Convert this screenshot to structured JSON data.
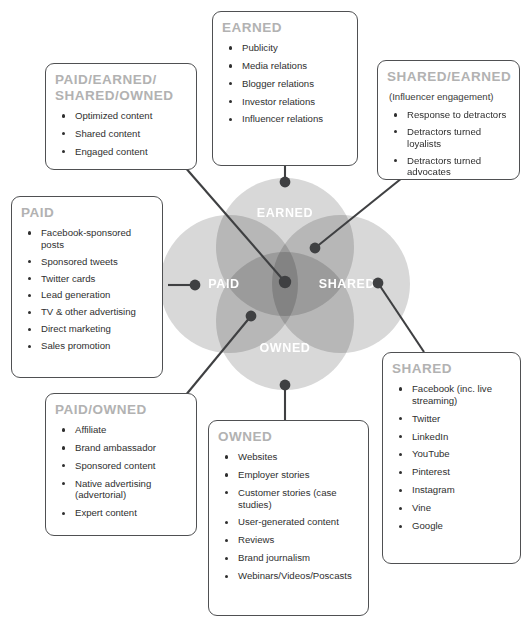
{
  "diagram": {
    "type": "venn-four-circle",
    "colors": {
      "circle_fill": "#c9c9c9",
      "circle_overlap": "#a8a8a8",
      "box_border": "#4f5052",
      "heading_text": "#b2b2b2",
      "body_text": "#2f2f2f",
      "venn_label_text": "#ffffff",
      "connector": "#3f4042",
      "background": "#ffffff"
    },
    "venn_labels": [
      {
        "name": "earned",
        "text": "EARNED"
      },
      {
        "name": "paid",
        "text": "PAID"
      },
      {
        "name": "shared",
        "text": "SHARED"
      },
      {
        "name": "owned",
        "text": "OWNED"
      }
    ]
  },
  "boxes": {
    "pes_owned": {
      "heading_line1": "PAID/EARNED/",
      "heading_line2": "SHARED/OWNED",
      "items": [
        "Optimized content",
        "Shared content",
        "Engaged content"
      ]
    },
    "earned": {
      "heading": "EARNED",
      "items": [
        "Publicity",
        "Media relations",
        "Blogger relations",
        "Investor relations",
        "Influencer relations"
      ]
    },
    "shared_earned": {
      "heading": "SHARED/EARNED",
      "subtitle": "(Influencer engagement)",
      "items": [
        "Response to detractors",
        "Detractors turned loyalists",
        "Detractors turned advocates"
      ]
    },
    "paid": {
      "heading": "PAID",
      "items": [
        "Facebook-sponsored posts",
        "Sponsored tweets",
        "Twitter cards",
        "Lead generation",
        "TV & other advertising",
        "Direct marketing",
        "Sales promotion"
      ]
    },
    "paid_owned": {
      "heading": "PAID/OWNED",
      "items": [
        "Affiliate",
        "Brand ambassador",
        "Sponsored content",
        "Native advertising (advertorial)",
        "Expert content"
      ]
    },
    "owned": {
      "heading": "OWNED",
      "items": [
        "Websites",
        "Employer stories",
        "Customer stories (case studies)",
        "User-generated content",
        "Reviews",
        "Brand journalism",
        "Webinars/Videos/Poscasts"
      ]
    },
    "shared": {
      "heading": "SHARED",
      "items": [
        "Facebook (inc. live streaming)",
        "Twitter",
        "LinkedIn",
        "YouTube",
        "Pinterest",
        "Instagram",
        "Vine",
        "Google"
      ]
    }
  }
}
